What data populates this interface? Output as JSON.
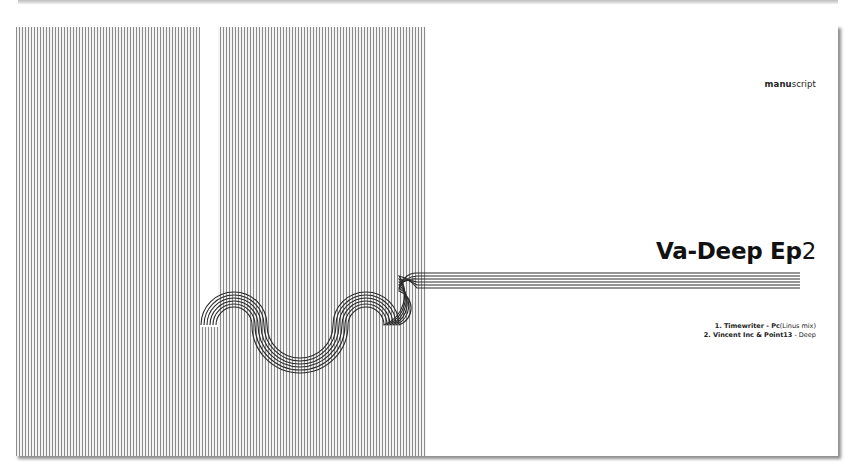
{
  "brand": {
    "bold": "manu",
    "regular": "script"
  },
  "title": {
    "bold": "Va-Deep Ep",
    "light": "2"
  },
  "tracks": [
    {
      "number": "1.",
      "artist": "Timewriter",
      "sep": " - ",
      "title": "Pc",
      "note": "(Linus mix)"
    },
    {
      "number": "2.",
      "artist": "Vincent Inc & Point13",
      "sep": " - ",
      "title": "",
      "note": "Deep"
    }
  ],
  "colors": {
    "stripe": "#8a8a8a",
    "background": "#ffffff",
    "text": "#111111"
  }
}
